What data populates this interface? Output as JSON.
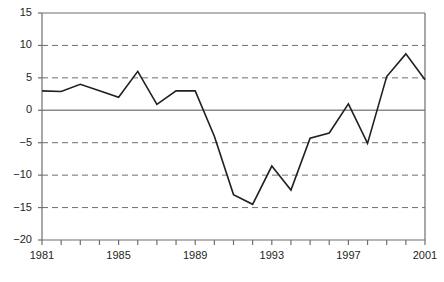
{
  "chart_data": {
    "type": "line",
    "title": "",
    "subtitle": "",
    "xlabel": "",
    "ylabel": "",
    "x": [
      1981,
      1982,
      1983,
      1984,
      1985,
      1986,
      1987,
      1988,
      1989,
      1990,
      1991,
      1992,
      1993,
      1994,
      1995,
      1996,
      1997,
      1998,
      1999,
      2000,
      2001
    ],
    "values": [
      3.0,
      2.9,
      4.0,
      3.0,
      2.0,
      6.0,
      0.9,
      3.0,
      3.0,
      -4.0,
      -13.0,
      -14.5,
      -8.6,
      -12.3,
      -4.3,
      -3.5,
      1.0,
      -5.1,
      5.2,
      8.7,
      4.7
    ],
    "series": [
      {
        "name": "series-1",
        "values": [
          3.0,
          2.9,
          4.0,
          3.0,
          2.0,
          6.0,
          0.9,
          3.0,
          3.0,
          -4.0,
          -13.0,
          -14.5,
          -8.6,
          -12.3,
          -4.3,
          -3.5,
          1.0,
          -5.1,
          5.2,
          8.7,
          4.7
        ],
        "color": "#231f20"
      }
    ],
    "xlim": [
      1981,
      2001
    ],
    "ylim": [
      -20,
      15
    ],
    "ytick_values": [
      15,
      10,
      5,
      0,
      -5,
      -10,
      -15,
      -20
    ],
    "ytick_labels": [
      "15",
      "10",
      "5",
      "0",
      "−5",
      "−10",
      "−15",
      "−20"
    ],
    "xtick_values": [
      1981,
      1982,
      1983,
      1984,
      1985,
      1986,
      1987,
      1988,
      1989,
      1990,
      1991,
      1992,
      1993,
      1994,
      1995,
      1996,
      1997,
      1998,
      1999,
      2000,
      2001
    ],
    "xtick_labels_shown": [
      "1981",
      "1985",
      "1989",
      "1993",
      "1997",
      "2001"
    ],
    "xtick_labels_shown_values": [
      1981,
      1985,
      1989,
      1993,
      1997,
      2001
    ],
    "grid": {
      "horizontal": true,
      "horizontal_style": "dashed",
      "horizontal_at": [
        10,
        5,
        -5,
        -10,
        -15
      ],
      "zero_line": true,
      "zero_line_style": "solid",
      "vertical": false
    },
    "legend": {
      "visible": false,
      "position": "none"
    },
    "colors": {
      "line": "#231f20",
      "axis": "#6f6f6f",
      "grid": "#6f6f6f",
      "zero_line": "#8a8a8a",
      "text": "#231f20",
      "background": "#ffffff"
    },
    "axes_box": {
      "left": 42,
      "right": 425,
      "top": 13,
      "bottom": 240
    }
  }
}
